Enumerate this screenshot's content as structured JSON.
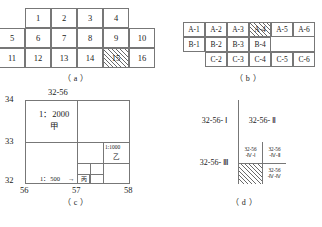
{
  "figure": {
    "panels": [
      {
        "key": "a",
        "caption": "（ a ）"
      },
      {
        "key": "b",
        "caption": "（ b ）"
      },
      {
        "key": "c",
        "caption": "（ c ）"
      },
      {
        "key": "d",
        "caption": "（ d ）"
      }
    ]
  },
  "panel_a": {
    "caption": "（ a ）",
    "row_top": [
      "1",
      "2",
      "3",
      "4"
    ],
    "row_mid": [
      "5",
      "6",
      "7",
      "8",
      "9",
      "10"
    ],
    "row_bottom": [
      "11",
      "12",
      "13",
      "14",
      "15",
      "16"
    ],
    "hatched_cell": "15"
  },
  "panel_b": {
    "caption": "（ b ）",
    "row_a": [
      "A-1",
      "A-2",
      "A-3",
      "A-4",
      "A-5",
      "A-6"
    ],
    "row_b": [
      "B-1",
      "B-2",
      "B-3",
      "B-4"
    ],
    "row_c": [
      "C-2",
      "C-3",
      "C-4",
      "C-5",
      "C-6"
    ],
    "hatched_cell": "A-4"
  },
  "panel_c": {
    "caption": "（ c ）",
    "top_label": "32-56",
    "y_axis_labels": [
      "34",
      "33",
      "32"
    ],
    "x_axis_labels": [
      "56",
      "57",
      "58"
    ],
    "scale_2000": "1：2000",
    "name_jia": "甲",
    "scale_1000": "1:1000",
    "name_yi": "乙",
    "scale_500": "1：500",
    "arrow": "→",
    "name_bing": "丙"
  },
  "panel_d": {
    "caption": "（ d ）",
    "quad_i": "32-56- Ⅰ",
    "quad_ii": "32-56- Ⅱ",
    "quad_iii": "32-56- Ⅲ",
    "sub_iv_i": [
      "32-56",
      "-Ⅳ-Ⅰ"
    ],
    "sub_iv_ii": [
      "32-56",
      "-Ⅳ-Ⅱ"
    ],
    "sub_iv_iv": [
      "32-56",
      "-Ⅳ-Ⅳ"
    ],
    "hatched_cell": "32-56-Ⅳ-Ⅲ"
  },
  "colors": {
    "stroke": "#777777",
    "text": "#1a1a1a",
    "background": "#ffffff"
  }
}
